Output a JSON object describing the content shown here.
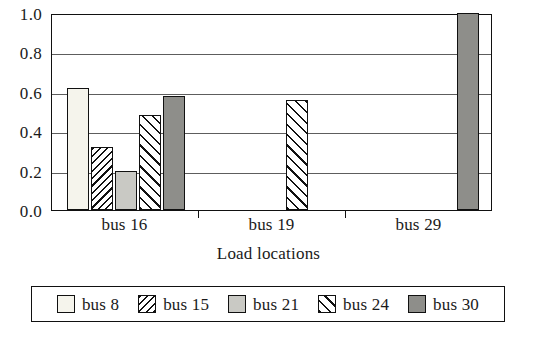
{
  "chart_data": {
    "type": "bar",
    "title": "",
    "subtitle": "",
    "xlabel": "Load locations",
    "ylabel": "",
    "categories": [
      "bus 16",
      "bus 19",
      "bus 29"
    ],
    "series": [
      {
        "name": "bus 8",
        "values": [
          0.62,
          0.0,
          0.0
        ],
        "pattern": "solid-white",
        "color": "#f5f4ec"
      },
      {
        "name": "bus 15",
        "values": [
          0.32,
          0.0,
          0.0
        ],
        "pattern": "hatch-dense-backslash",
        "color": "#ffffff"
      },
      {
        "name": "bus 21",
        "values": [
          0.2,
          0.0,
          0.0
        ],
        "pattern": "solid-lightgray",
        "color": "#c9c9c4"
      },
      {
        "name": "bus 24",
        "values": [
          0.48,
          0.56,
          0.0
        ],
        "pattern": "hatch-wide-slash",
        "color": "#ffffff"
      },
      {
        "name": "bus 30",
        "values": [
          0.58,
          0.0,
          1.0
        ],
        "pattern": "solid-darkgray",
        "color": "#8e8e8a"
      }
    ],
    "ylim": [
      0.0,
      1.0
    ],
    "yticks": [
      "0.0",
      "0.2",
      "0.4",
      "0.6",
      "0.8",
      "1.0"
    ],
    "ytick_values": [
      0.0,
      0.2,
      0.4,
      0.6,
      0.8,
      1.0
    ],
    "grid": true,
    "grid_axis": "y",
    "legend_position": "bottom",
    "legend_entries": [
      "bus 8",
      "bus 15",
      "bus 21",
      "bus 24",
      "bus 30"
    ]
  },
  "axis": {
    "y_labels": [
      "1.0",
      "0.8",
      "0.6",
      "0.4",
      "0.2",
      "0.0"
    ],
    "x_labels": [
      "bus 16",
      "bus 19",
      "bus 29"
    ],
    "x_title": "Load locations"
  },
  "legend": {
    "items": [
      {
        "label": "bus 8"
      },
      {
        "label": "bus 15"
      },
      {
        "label": "bus 21"
      },
      {
        "label": "bus 24"
      },
      {
        "label": "bus 30"
      }
    ]
  }
}
